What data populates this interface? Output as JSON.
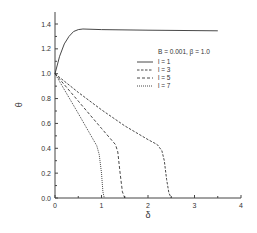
{
  "chart_data": {
    "type": "line",
    "title": "",
    "xlabel": "δ",
    "ylabel": "θ",
    "xlim": [
      0,
      4
    ],
    "ylim": [
      0,
      1.5
    ],
    "xticks": [
      "0",
      "1",
      "2",
      "3",
      "4"
    ],
    "yticks": [
      "0.0",
      "0.2",
      "0.4",
      "0.6",
      "0.8",
      "1.0",
      "1.2",
      "1.4"
    ],
    "grid": false,
    "legend_title": "B = 0.001, β = 1.0",
    "legend_position": "upper right",
    "series": [
      {
        "name": "l = 1",
        "style": "solid",
        "x": [
          0,
          0.1,
          0.2,
          0.3,
          0.4,
          0.5,
          0.6,
          1.0,
          2.0,
          3.5
        ],
        "y": [
          1.0,
          1.14,
          1.24,
          1.3,
          1.34,
          1.355,
          1.36,
          1.355,
          1.35,
          1.345
        ]
      },
      {
        "name": "l = 3",
        "style": "dashed",
        "x": [
          0,
          0.5,
          1.0,
          1.5,
          2.0,
          2.2,
          2.3,
          2.35,
          2.4,
          2.45,
          2.5
        ],
        "y": [
          1.0,
          0.85,
          0.71,
          0.58,
          0.47,
          0.43,
          0.38,
          0.3,
          0.15,
          0.04,
          0.0
        ]
      },
      {
        "name": "l = 5",
        "style": "dashed-long",
        "x": [
          0,
          0.5,
          1.0,
          1.3,
          1.35,
          1.4,
          1.45,
          1.5
        ],
        "y": [
          1.0,
          0.78,
          0.56,
          0.43,
          0.37,
          0.2,
          0.05,
          0.0
        ]
      },
      {
        "name": "l = 7",
        "style": "dotted",
        "x": [
          0,
          0.5,
          0.9,
          0.95,
          1.0,
          1.03,
          1.06
        ],
        "y": [
          1.0,
          0.68,
          0.42,
          0.35,
          0.2,
          0.05,
          0.0
        ]
      }
    ]
  }
}
